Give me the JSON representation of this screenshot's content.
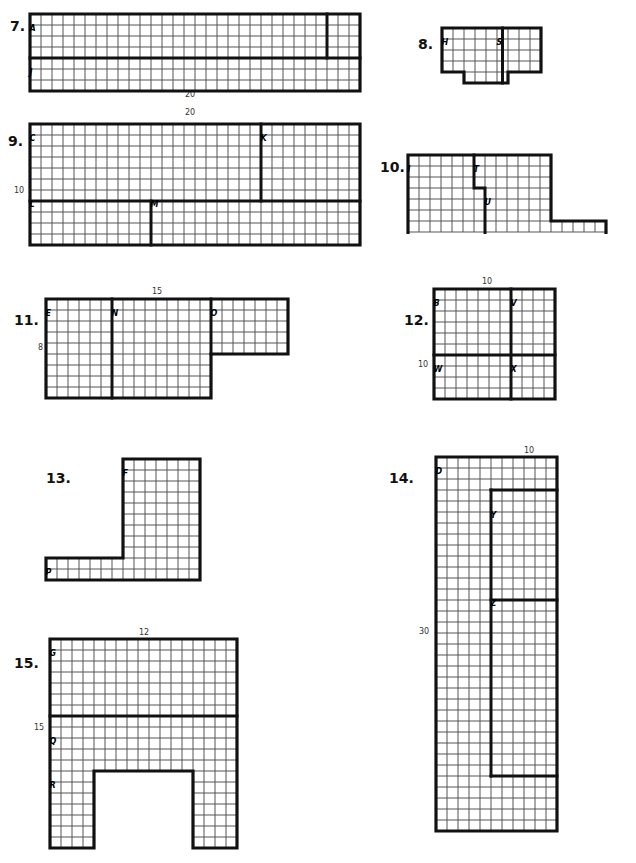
{
  "page": {
    "width": 636,
    "height": 863,
    "background": "#ffffff",
    "grid_line_color": "#555555",
    "outline_color": "#111111",
    "cell_size": 11
  },
  "problems": [
    {
      "number": "7.",
      "num_x": 10,
      "num_y": 18,
      "origin_x": 28,
      "origin_y": 12,
      "cols": 30,
      "rows": 7,
      "cell": 11,
      "dimensions": [
        {
          "text": "20",
          "x": 185,
          "y": 90,
          "orient": "horizontal"
        }
      ],
      "labels": [
        {
          "text": "A",
          "col": 0,
          "row": 1
        },
        {
          "text": "J",
          "col": 0,
          "row": 5
        }
      ],
      "outline": "M0,0 H330 V77 H0 Z",
      "dividers": [
        {
          "d": "M0,44 H330"
        },
        {
          "d": "M297,0 V44"
        }
      ]
    },
    {
      "number": "8.",
      "num_x": 418,
      "num_y": 36,
      "origin_x": 440,
      "origin_y": 26,
      "cols": 9,
      "rows": 5,
      "cell": 11,
      "dimensions": [],
      "labels": [
        {
          "text": "H",
          "col": 0,
          "row": 1
        },
        {
          "text": "S",
          "col": 5,
          "row": 1
        }
      ],
      "outline": "M0,0 H99 V44 H66 V55 H22 V44 H0 Z",
      "dividers": [
        {
          "d": "M60.5,0 V55"
        }
      ]
    },
    {
      "number": "9.",
      "num_x": 8,
      "num_y": 133,
      "origin_x": 28,
      "origin_y": 122,
      "cols": 30,
      "rows": 11,
      "cell": 11,
      "dimensions": [
        {
          "text": "20",
          "x": 185,
          "y": 108,
          "orient": "horizontal"
        },
        {
          "text": "10",
          "x": 14,
          "y": 186,
          "orient": "vertical"
        }
      ],
      "labels": [
        {
          "text": "C",
          "col": 0,
          "row": 1
        },
        {
          "text": "K",
          "col": 21,
          "row": 1
        },
        {
          "text": "L",
          "col": 0,
          "row": 7
        },
        {
          "text": "M",
          "col": 11,
          "row": 7
        }
      ],
      "outline": "M0,0 H330 V121 H0 Z",
      "dividers": [
        {
          "d": "M0,77 H330"
        },
        {
          "d": "M231,0 V77"
        },
        {
          "d": "M121,77 V121"
        }
      ]
    },
    {
      "number": "10.",
      "num_x": 380,
      "num_y": 159,
      "origin_x": 406,
      "origin_y": 153,
      "cols": 18,
      "rows": 7,
      "cell": 11,
      "dimensions": [],
      "labels": [
        {
          "text": "I",
          "col": 0,
          "row": 1
        },
        {
          "text": "T",
          "col": 6,
          "row": 1
        },
        {
          "text": "U",
          "col": 7,
          "row": 4
        }
      ],
      "outline": "M0,0 H143 V66 H198 V88 H0 Z",
      "dividers": [
        {
          "d": "M66,0 V33 H77 V88"
        }
      ]
    },
    {
      "number": "11.",
      "num_x": 14,
      "num_y": 312,
      "origin_x": 44,
      "origin_y": 297,
      "cols": 22,
      "rows": 9,
      "cell": 11,
      "dimensions": [
        {
          "text": "15",
          "x": 152,
          "y": 287,
          "orient": "horizontal"
        },
        {
          "text": "8",
          "x": 38,
          "y": 343,
          "orient": "vertical"
        }
      ],
      "labels": [
        {
          "text": "E",
          "col": 0,
          "row": 1
        },
        {
          "text": "N",
          "col": 6,
          "row": 1
        },
        {
          "text": "O",
          "col": 15,
          "row": 1
        }
      ],
      "outline": "M0,0 H242 V55 H165 V99 H0 Z",
      "dividers": [
        {
          "d": "M66,0 V99"
        },
        {
          "d": "M165,0 V55"
        }
      ]
    },
    {
      "number": "12.",
      "num_x": 404,
      "num_y": 312,
      "origin_x": 432,
      "origin_y": 287,
      "cols": 11,
      "rows": 10,
      "cell": 11,
      "dimensions": [
        {
          "text": "10",
          "x": 482,
          "y": 277,
          "orient": "horizontal"
        },
        {
          "text": "10",
          "x": 418,
          "y": 360,
          "orient": "vertical"
        }
      ],
      "labels": [
        {
          "text": "B",
          "col": 0,
          "row": 1
        },
        {
          "text": "V",
          "col": 7,
          "row": 1
        },
        {
          "text": "W",
          "col": 0,
          "row": 7
        },
        {
          "text": "X",
          "col": 7,
          "row": 7
        }
      ],
      "outline": "M0,0 H121 V110 H0 Z",
      "dividers": [
        {
          "d": "M0,66 H121"
        },
        {
          "d": "M77,0 V110"
        }
      ]
    },
    {
      "number": "13.",
      "num_x": 46,
      "num_y": 470,
      "origin_x": 44,
      "origin_y": 457,
      "cols": 14,
      "rows": 11,
      "cell": 11,
      "dimensions": [],
      "labels": [
        {
          "text": "F",
          "col": 7,
          "row": 1
        },
        {
          "text": "P",
          "col": 0,
          "row": 10
        }
      ],
      "outline": "M77,0 H154 V121 H0 V99 H77 Z",
      "dividers": []
    },
    {
      "number": "14.",
      "num_x": 389,
      "num_y": 470,
      "origin_x": 434,
      "origin_y": 455,
      "cols": 11,
      "rows": 34,
      "cell": 11,
      "dimensions": [
        {
          "text": "10",
          "x": 524,
          "y": 446,
          "orient": "horizontal"
        },
        {
          "text": "30",
          "x": 419,
          "y": 627,
          "orient": "vertical"
        }
      ],
      "labels": [
        {
          "text": "D",
          "col": 0,
          "row": 1
        },
        {
          "text": "Y",
          "col": 5,
          "row": 5
        },
        {
          "text": "Z",
          "col": 5,
          "row": 13
        }
      ],
      "outline": "M0,0 H121 V374 H0 Z",
      "dividers": [
        {
          "d": "M55,33 H121"
        },
        {
          "d": "M55,33 V319"
        },
        {
          "d": "M55,143 H121"
        },
        {
          "d": "M55,319 H121"
        }
      ]
    },
    {
      "number": "15.",
      "num_x": 14,
      "num_y": 655,
      "origin_x": 48,
      "origin_y": 637,
      "cols": 17,
      "rows": 19,
      "cell": 11,
      "dimensions": [
        {
          "text": "12",
          "x": 139,
          "y": 628,
          "orient": "horizontal"
        },
        {
          "text": "15",
          "x": 34,
          "y": 723,
          "orient": "vertical"
        }
      ],
      "labels": [
        {
          "text": "G",
          "col": 0,
          "row": 1
        },
        {
          "text": "Q",
          "col": 0,
          "row": 9
        },
        {
          "text": "R",
          "col": 0,
          "row": 13
        }
      ],
      "outline": "M0,0 H187 V209 H143 V132 H44 V209 H0 Z",
      "dividers": [
        {
          "d": "M0,77 H187"
        }
      ]
    }
  ]
}
